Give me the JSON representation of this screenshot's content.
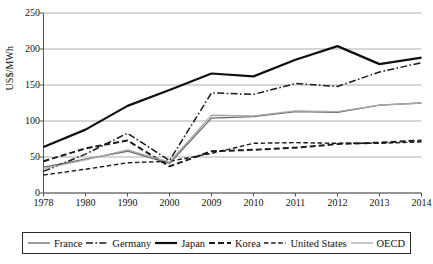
{
  "chart_data": {
    "type": "line",
    "title": "",
    "xlabel": "",
    "ylabel": "US$/MWh",
    "categories": [
      "1978",
      "1980",
      "1990",
      "2000",
      "2009",
      "2010",
      "2011",
      "2012",
      "2013",
      "2014"
    ],
    "xtick_labels": [
      "1978",
      "1980",
      "1990",
      "2000",
      "2009",
      "2010",
      "2011",
      "2012",
      "2013",
      "2014"
    ],
    "ytick_labels": [
      "0",
      "50",
      "100",
      "150",
      "200",
      "250"
    ],
    "ytick_values": [
      0,
      50,
      100,
      150,
      200,
      250
    ],
    "ylim": [
      0,
      250
    ],
    "grid": "horizontal",
    "legend_position": "bottom",
    "series": [
      {
        "name": "France",
        "style": "solid-thin",
        "color": "#6a6a6a",
        "values": [
          36,
          47,
          58,
          41,
          104,
          106,
          113,
          112,
          122,
          125
        ]
      },
      {
        "name": "Germany",
        "style": "dash-dot",
        "color": "#1a1a1a",
        "values": [
          30,
          54,
          83,
          45,
          139,
          137,
          152,
          148,
          168,
          181
        ]
      },
      {
        "name": "Japan",
        "style": "solid-thick",
        "color": "#101010",
        "values": [
          64,
          88,
          121,
          143,
          166,
          162,
          185,
          204,
          179,
          188
        ]
      },
      {
        "name": "Korea",
        "style": "dash-thick",
        "color": "#1a1a1a",
        "values": [
          44,
          62,
          73,
          37,
          58,
          60,
          63,
          68,
          70,
          73
        ]
      },
      {
        "name": "United States",
        "style": "dash-thin",
        "color": "#1a1a1a",
        "values": [
          25,
          33,
          42,
          44,
          55,
          69,
          70,
          69,
          69,
          71
        ]
      },
      {
        "name": "OECD",
        "style": "solid-light",
        "color": "#a9a9a9",
        "values": [
          34,
          46,
          60,
          43,
          108,
          107,
          114,
          113,
          122,
          125
        ]
      }
    ]
  },
  "legend": {
    "items": [
      {
        "label": "France",
        "swatch": "solid-thin-gray-line-icon"
      },
      {
        "label": "Germany",
        "swatch": "dash-dot-line-icon"
      },
      {
        "label": "Japan",
        "swatch": "solid-thick-line-icon"
      },
      {
        "label": "Korea",
        "swatch": "dashed-thick-line-icon"
      },
      {
        "label": "United States",
        "swatch": "dashed-thin-line-icon"
      },
      {
        "label": "OECD",
        "swatch": "solid-light-gray-line-icon"
      }
    ]
  },
  "axes": {
    "y_title": "US$/MWh"
  }
}
